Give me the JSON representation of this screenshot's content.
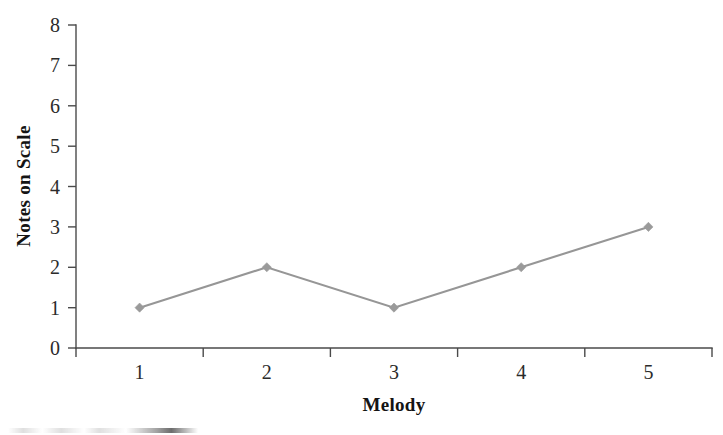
{
  "chart_data": {
    "type": "line",
    "title": "",
    "subtitle": "",
    "xlabel": "Melody",
    "ylabel": "Notes on Scale",
    "categories": [
      "1",
      "2",
      "3",
      "4",
      "5"
    ],
    "x": [
      1,
      2,
      3,
      4,
      5
    ],
    "values": [
      1,
      2,
      1,
      2,
      3
    ],
    "series": [
      {
        "name": "Notes on Scale",
        "values": [
          1,
          2,
          1,
          2,
          3
        ]
      }
    ],
    "xlim": [
      0.5,
      5.5
    ],
    "ylim": [
      0,
      8
    ],
    "y_ticks": [
      "0",
      "1",
      "2",
      "3",
      "4",
      "5",
      "6",
      "7",
      "8"
    ],
    "x_ticks": [
      "1",
      "2",
      "3",
      "4",
      "5"
    ],
    "grid": false,
    "legend": false,
    "legend_position": "none",
    "marker": "diamond",
    "line_color": "#969696",
    "marker_color": "#9a9a9a",
    "axis_color": "#4a4a4a",
    "background_color": "#ffffff"
  }
}
